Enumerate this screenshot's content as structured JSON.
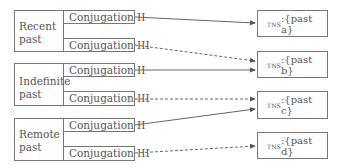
{
  "groups": [
    {
      "label_line1": "Recent",
      "label_line2": "past",
      "conj_a": "Conjugation II",
      "conj_b": "Conjugation III"
    },
    {
      "label_line1": "Indefinite",
      "label_line2": "past",
      "conj_a": "Conjugation II",
      "conj_b": "Conjugation III"
    },
    {
      "label_line1": "Remote",
      "label_line2": "past",
      "conj_a": "Conjugation II",
      "conj_b": "Conjugation III"
    }
  ],
  "targets": [
    {
      "feature": "tns",
      "value": ":{past a}"
    },
    {
      "feature": "tns",
      "value": ":{past b}"
    },
    {
      "feature": "tns",
      "value": ":{past c}"
    },
    {
      "feature": "tns",
      "value": ":{past d}"
    }
  ],
  "edges": [
    {
      "from": "Recent past / Conjugation II",
      "to": "past a",
      "style": "solid"
    },
    {
      "from": "Recent past / Conjugation III",
      "to": "past b",
      "style": "dashed"
    },
    {
      "from": "Indefinite past / Conjugation II",
      "to": "past b",
      "style": "solid"
    },
    {
      "from": "Indefinite past / Conjugation III",
      "to": "past c",
      "style": "dashed"
    },
    {
      "from": "Remote past / Conjugation II",
      "to": "past c",
      "style": "solid"
    },
    {
      "from": "Remote past / Conjugation III",
      "to": "past d",
      "style": "dashed"
    }
  ]
}
